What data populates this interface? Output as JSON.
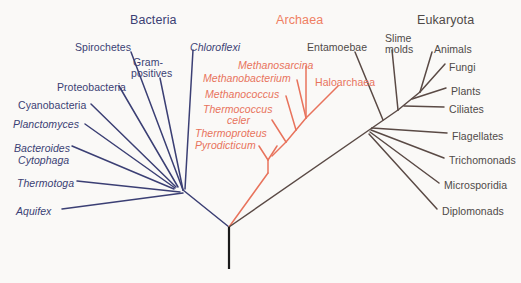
{
  "figure": {
    "kind": "unrooted-phylogenetic-tree",
    "background_color": "#faf9f7"
  },
  "colors": {
    "bacteria": "#3b3f74",
    "archaea": "#e8735c",
    "archaea_title": "#ef7f63",
    "eukaryota": "#5a4a45",
    "eukaryota_text": "#4f4a48",
    "root_stem": "#1a1a1a"
  },
  "domains": [
    {
      "id": "bacteria",
      "label": "Bacteria",
      "color": "#3b3f74",
      "x": 130,
      "y": 14
    },
    {
      "id": "archaea",
      "label": "Archaea",
      "color": "#ef7f63",
      "x": 276,
      "y": 14
    },
    {
      "id": "eukaryota",
      "label": "Eukaryota",
      "color": "#4f4a48",
      "x": 417,
      "y": 14
    }
  ],
  "bacteria_taxa": [
    {
      "label": "Spirochetes",
      "italic": false,
      "x": 75,
      "y": 42,
      "align": "left"
    },
    {
      "label": "Gram-",
      "italic": false,
      "x": 133,
      "y": 57,
      "align": "left"
    },
    {
      "label": "positives",
      "italic": false,
      "x": 131,
      "y": 68,
      "align": "left"
    },
    {
      "label": "Chloroflexi",
      "italic": true,
      "x": 190,
      "y": 42,
      "align": "left"
    },
    {
      "label": "Proteobacteria",
      "italic": false,
      "x": 57,
      "y": 82,
      "align": "left"
    },
    {
      "label": "Cyanobacteria",
      "italic": false,
      "x": 18,
      "y": 100,
      "align": "left"
    },
    {
      "label": "Planctomyces",
      "italic": true,
      "x": 13,
      "y": 119,
      "align": "left"
    },
    {
      "label": "Bacteroides",
      "italic": true,
      "x": 14,
      "y": 143,
      "align": "left"
    },
    {
      "label": "Cytophaga",
      "italic": true,
      "x": 18,
      "y": 155,
      "align": "left"
    },
    {
      "label": "Thermotoga",
      "italic": true,
      "x": 17,
      "y": 178,
      "align": "left"
    },
    {
      "label": "Aquifex",
      "italic": true,
      "x": 16,
      "y": 206,
      "align": "left"
    }
  ],
  "archaea_taxa": [
    {
      "label": "Methanosarcina",
      "italic": true,
      "x": 238,
      "y": 60,
      "align": "left"
    },
    {
      "label": "Methanobacterium",
      "italic": true,
      "x": 203,
      "y": 73,
      "align": "left"
    },
    {
      "label": "Methanococcus",
      "italic": true,
      "x": 205,
      "y": 89,
      "align": "left"
    },
    {
      "label": "Thermococcus",
      "italic": true,
      "x": 203,
      "y": 104,
      "align": "left"
    },
    {
      "label": "celer",
      "italic": true,
      "x": 227,
      "y": 115,
      "align": "left"
    },
    {
      "label": "Thermoproteus",
      "italic": true,
      "x": 195,
      "y": 128,
      "align": "left"
    },
    {
      "label": "Pyrodicticum",
      "italic": true,
      "x": 195,
      "y": 140,
      "align": "left"
    },
    {
      "label": "Haloarchaea",
      "italic": false,
      "x": 315,
      "y": 77,
      "align": "left"
    }
  ],
  "eukaryota_taxa": [
    {
      "label": "Entamoebae",
      "italic": false,
      "x": 307,
      "y": 42,
      "align": "left"
    },
    {
      "label": "Slime",
      "italic": false,
      "x": 385,
      "y": 33,
      "align": "left"
    },
    {
      "label": "molds",
      "italic": false,
      "x": 385,
      "y": 44,
      "align": "left"
    },
    {
      "label": "Animals",
      "italic": false,
      "x": 434,
      "y": 44,
      "align": "left"
    },
    {
      "label": "Fungi",
      "italic": false,
      "x": 449,
      "y": 62,
      "align": "left"
    },
    {
      "label": "Plants",
      "italic": false,
      "x": 451,
      "y": 86,
      "align": "left"
    },
    {
      "label": "Ciliates",
      "italic": false,
      "x": 449,
      "y": 104,
      "align": "left"
    },
    {
      "label": "Flagellates",
      "italic": false,
      "x": 452,
      "y": 131,
      "align": "left"
    },
    {
      "label": "Trichomonads",
      "italic": false,
      "x": 449,
      "y": 155,
      "align": "left"
    },
    {
      "label": "Microsporidia",
      "italic": false,
      "x": 444,
      "y": 180,
      "align": "left"
    },
    {
      "label": "Diplomonads",
      "italic": false,
      "x": 442,
      "y": 206,
      "align": "left"
    }
  ],
  "tree_structure": {
    "root": {
      "x": 229,
      "y": 227
    },
    "root_stem_bottom": {
      "x": 229,
      "y": 269
    },
    "bacteria_hub": {
      "x": 183,
      "y": 190
    },
    "bacteria_inner_node": {
      "x": 172,
      "y": 180
    },
    "archaea_base": {
      "x": 268,
      "y": 173
    },
    "archaea_fork": {
      "x": 268,
      "y": 160
    },
    "eukaryota_lower_node": {
      "x": 372,
      "y": 128
    },
    "eukaryota_crown_node": {
      "x": 398,
      "y": 110
    }
  },
  "edges": {
    "bacteria": [
      {
        "name": "spirochetes-branch",
        "x1": 183,
        "y1": 190,
        "x2": 131,
        "y2": 52
      },
      {
        "name": "gram-positives-branch",
        "x1": 183,
        "y1": 190,
        "x2": 160,
        "y2": 78
      },
      {
        "name": "chloroflexi-branch",
        "x1": 185,
        "y1": 189,
        "x2": 193,
        "y2": 50
      },
      {
        "name": "proteobacteria-branch",
        "x1": 178,
        "y1": 187,
        "x2": 119,
        "y2": 86
      },
      {
        "name": "cyanobacteria-branch",
        "x1": 176,
        "y1": 187,
        "x2": 91,
        "y2": 104
      },
      {
        "name": "planctomyces-branch",
        "x1": 175,
        "y1": 188,
        "x2": 85,
        "y2": 124
      },
      {
        "name": "bacteroides-branch",
        "x1": 174,
        "y1": 189,
        "x2": 72,
        "y2": 146
      },
      {
        "name": "thermotoga-branch",
        "x1": 180,
        "y1": 192,
        "x2": 77,
        "y2": 181
      },
      {
        "name": "aquifex-branch",
        "x1": 183,
        "y1": 193,
        "x2": 62,
        "y2": 209
      },
      {
        "name": "bacteria-stem",
        "x1": 229,
        "y1": 227,
        "x2": 183,
        "y2": 190
      }
    ],
    "archaea": [
      {
        "name": "archaea-stem",
        "x1": 229,
        "y1": 227,
        "x2": 268,
        "y2": 173
      },
      {
        "name": "archaea-spine-lower",
        "x1": 268,
        "y1": 173,
        "x2": 268,
        "y2": 160
      },
      {
        "name": "pyrodicticum-branch",
        "x1": 268,
        "y1": 160,
        "x2": 259,
        "y2": 146
      },
      {
        "name": "thermoproteus-branch",
        "x1": 268,
        "y1": 160,
        "x2": 277,
        "y2": 146
      },
      {
        "name": "archaea-spine-mid",
        "x1": 272,
        "y1": 156,
        "x2": 286,
        "y2": 142
      },
      {
        "name": "thermococcus-celer-branch",
        "x1": 286,
        "y1": 142,
        "x2": 272,
        "y2": 120
      },
      {
        "name": "archaea-spine-upper",
        "x1": 286,
        "y1": 142,
        "x2": 296,
        "y2": 130
      },
      {
        "name": "methanococcus-branch",
        "x1": 296,
        "y1": 130,
        "x2": 286,
        "y2": 96
      },
      {
        "name": "archaea-spine-top",
        "x1": 296,
        "y1": 130,
        "x2": 306,
        "y2": 118
      },
      {
        "name": "methanobacterium-branch",
        "x1": 306,
        "y1": 118,
        "x2": 297,
        "y2": 80
      },
      {
        "name": "methanosarcina-branch",
        "x1": 306,
        "y1": 118,
        "x2": 306,
        "y2": 66
      },
      {
        "name": "haloarchaea-branch",
        "x1": 306,
        "y1": 118,
        "x2": 338,
        "y2": 86
      }
    ],
    "eukaryota": [
      {
        "name": "eukaryota-stem",
        "x1": 229,
        "y1": 227,
        "x2": 372,
        "y2": 128
      },
      {
        "name": "entamoebae-branch",
        "x1": 383,
        "y1": 120,
        "x2": 355,
        "y2": 52
      },
      {
        "name": "euk-crown-link",
        "x1": 372,
        "y1": 128,
        "x2": 398,
        "y2": 110
      },
      {
        "name": "slime-molds-branch",
        "x1": 398,
        "y1": 110,
        "x2": 392,
        "y2": 50
      },
      {
        "name": "animals-branch",
        "x1": 420,
        "y1": 92,
        "x2": 432,
        "y2": 52
      },
      {
        "name": "fungi-branch",
        "x1": 420,
        "y1": 92,
        "x2": 445,
        "y2": 64
      },
      {
        "name": "euk-crown-upper-link",
        "x1": 398,
        "y1": 110,
        "x2": 420,
        "y2": 92
      },
      {
        "name": "plants-branch",
        "x1": 412,
        "y1": 99,
        "x2": 446,
        "y2": 88
      },
      {
        "name": "ciliates-branch",
        "x1": 404,
        "y1": 106,
        "x2": 444,
        "y2": 107
      },
      {
        "name": "flagellates-branch",
        "x1": 372,
        "y1": 128,
        "x2": 447,
        "y2": 133
      },
      {
        "name": "trichomonads-branch",
        "x1": 371,
        "y1": 130,
        "x2": 444,
        "y2": 158
      },
      {
        "name": "microsporidia-branch",
        "x1": 370,
        "y1": 132,
        "x2": 439,
        "y2": 183
      },
      {
        "name": "diplomonads-branch",
        "x1": 369,
        "y1": 134,
        "x2": 437,
        "y2": 209
      }
    ]
  }
}
